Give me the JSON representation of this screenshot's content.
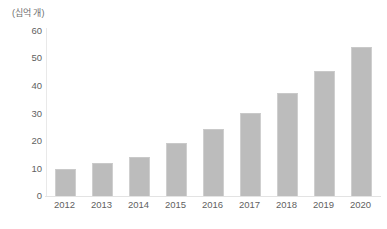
{
  "chart_data": {
    "type": "bar",
    "title": "",
    "subtitle": "",
    "xlabel": "",
    "ylabel": "(십억 개)",
    "unit_label": "(십억 개)",
    "categories": [
      "2012",
      "2013",
      "2014",
      "2015",
      "2016",
      "2017",
      "2018",
      "2019",
      "2020"
    ],
    "values": [
      9.5,
      11.5,
      14,
      19,
      24,
      30,
      37,
      45,
      54
    ],
    "series": [
      {
        "name": "",
        "values": [
          9.5,
          11.5,
          14,
          19,
          24,
          30,
          37,
          45,
          54
        ]
      }
    ],
    "ylim": [
      0,
      60
    ],
    "y_ticks": [
      0,
      10,
      20,
      30,
      40,
      50,
      60
    ],
    "y_tick_labels": [
      "0",
      "10",
      "20",
      "30",
      "40",
      "50",
      "60"
    ],
    "grid": false,
    "legend": false,
    "legend_position": "none",
    "bar_color": "#bcbcbc",
    "axis_color": "#e3e3e3",
    "text_color": "#5f5f5f"
  }
}
